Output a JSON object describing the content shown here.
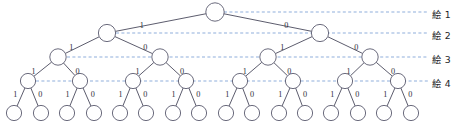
{
  "diagram": {
    "type": "binary-tree",
    "depth_levels": 5,
    "colors": {
      "node_stroke": "#5a5a6e",
      "node_fill": "#ffffff",
      "edge_stroke": "#4a4a5c",
      "guide_stroke": "#7b9fd4",
      "label_text": "#1e1e28"
    },
    "geometry": {
      "root": {
        "x": 215,
        "y": 12,
        "r": 9.2
      },
      "level_y": [
        12,
        33,
        57,
        81,
        113
      ],
      "level_r": [
        9.2,
        8.6,
        8.2,
        7.6,
        7.6
      ],
      "leaf_start_x": 14,
      "leaf_spacing": 26.47
    },
    "edge_labels": {
      "left": "1",
      "right": "0"
    },
    "levels": [
      {
        "index": 1,
        "label": "絵 1",
        "guide_y": 12,
        "nodes_x": [
          215
        ]
      },
      {
        "index": 2,
        "label": "絵 2",
        "guide_y": 33,
        "nodes_x": [
          107,
          320
        ]
      },
      {
        "index": 3,
        "label": "絵 3",
        "guide_y": 57,
        "nodes_x": [
          58,
          160,
          268,
          370
        ]
      },
      {
        "index": 4,
        "label": "絵 4",
        "guide_y": 81,
        "nodes_x": [
          28,
          80,
          133,
          186,
          240,
          293,
          345,
          398
        ]
      },
      {
        "index": 5,
        "label": "",
        "guide_y": 113,
        "nodes_x": [
          14,
          41,
          67,
          94,
          120,
          146,
          173,
          199,
          226,
          252,
          279,
          305,
          331,
          358,
          384,
          411
        ]
      }
    ],
    "level_labels": [
      {
        "text": "絵 1",
        "x": 432,
        "y": 7
      },
      {
        "text": "絵 2",
        "x": 432,
        "y": 28
      },
      {
        "text": "絵 3",
        "x": 432,
        "y": 52
      },
      {
        "text": "絵 4",
        "x": 432,
        "y": 76
      }
    ],
    "guide_lines": [
      {
        "x1": 224,
        "x2": 428,
        "y": 12
      },
      {
        "x1": 116,
        "x2": 428,
        "y": 33
      },
      {
        "x1": 67,
        "x2": 428,
        "y": 57
      },
      {
        "x1": 36,
        "x2": 428,
        "y": 81
      }
    ]
  }
}
